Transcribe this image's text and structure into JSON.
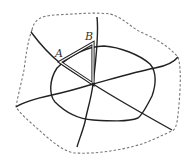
{
  "diagram": {
    "labels": {
      "a": "A",
      "b": "B"
    },
    "colors": {
      "stroke": "#222222",
      "boundary": "#777777",
      "background": "#ffffff"
    },
    "elements": {
      "boundary": "dashed outer region",
      "loop": "closed curve around center",
      "lines": [
        "NW-SE line",
        "N-S line",
        "W-E line"
      ],
      "triangle": "double-lined triangle A-B-center"
    }
  }
}
